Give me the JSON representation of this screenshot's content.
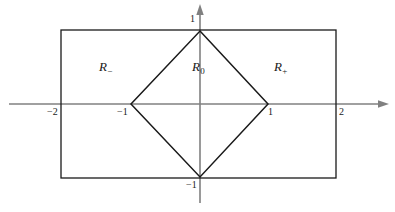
{
  "figure": {
    "name": "region-partition-diagram",
    "background_color": "#ffffff",
    "axis_color": "#808080",
    "shape_color": "#1a1a1a",
    "label_color": "#1a1a1a"
  },
  "axes": {
    "x_axis_name": "x-axis",
    "y_axis_name": "y-axis",
    "origin_px": {
      "x": 200,
      "y": 104
    },
    "unit_px": {
      "x": 68,
      "y": 73
    },
    "x_range": [
      -2.8,
      2.75
    ],
    "y_range": [
      -1.4,
      1.38
    ],
    "grid": false,
    "arrowheads": [
      "x-positive",
      "y-positive"
    ]
  },
  "ticks": [
    {
      "name": "tick-x-minus-2",
      "label": "−2",
      "axis": "x",
      "value": -2,
      "px": {
        "x": 47,
        "y": 107
      }
    },
    {
      "name": "tick-x-minus-1",
      "label": "−1",
      "axis": "x",
      "value": -1,
      "px": {
        "x": 117,
        "y": 107
      }
    },
    {
      "name": "tick-x-plus-1",
      "label": "1",
      "axis": "x",
      "value": 1,
      "px": {
        "x": 268,
        "y": 107
      }
    },
    {
      "name": "tick-x-plus-2",
      "label": "2",
      "axis": "x",
      "value": 2,
      "px": {
        "x": 339,
        "y": 107
      }
    },
    {
      "name": "tick-y-plus-1",
      "label": "1",
      "axis": "y",
      "value": 1,
      "px": {
        "x": 190,
        "y": 14
      }
    },
    {
      "name": "tick-y-minus-1",
      "label": "−1",
      "axis": "y",
      "value": -1,
      "px": {
        "x": 186,
        "y": 180
      }
    }
  ],
  "shapes": {
    "rectangle": {
      "name": "outer-rectangle",
      "x_min": -2,
      "x_max": 2,
      "y_min": -1,
      "y_max": 1,
      "px": {
        "x": 61,
        "y": 30,
        "width": 275,
        "height": 148
      },
      "stroke": "#1a1a1a",
      "fill": "none"
    },
    "diamond": {
      "name": "inner-diamond",
      "vertices": [
        [
          0,
          1
        ],
        [
          1,
          0
        ],
        [
          0,
          -1
        ],
        [
          -1,
          0
        ]
      ],
      "px_points": "200,31 268,104 200,177 131,104",
      "stroke": "#1a1a1a",
      "fill": "none"
    }
  },
  "regions": [
    {
      "name": "region-minus",
      "base": "R",
      "subscript": "−",
      "full_label": "R−",
      "px": {
        "x": 99,
        "y": 60
      }
    },
    {
      "name": "region-zero",
      "base": "R",
      "subscript": "0",
      "full_label": "R0",
      "px": {
        "x": 192,
        "y": 60
      }
    },
    {
      "name": "region-plus",
      "base": "R",
      "subscript": "+",
      "full_label": "R+",
      "px": {
        "x": 274,
        "y": 60
      }
    }
  ]
}
